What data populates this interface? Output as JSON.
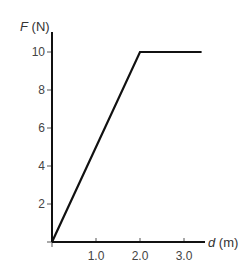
{
  "chart_data": {
    "type": "line",
    "title": "",
    "xlabel": "d (m)",
    "xlabel_var": "d",
    "xlabel_unit": " (m)",
    "ylabel": "F (N)",
    "ylabel_var": "F",
    "ylabel_unit": " (N)",
    "xlim": [
      0,
      3.5
    ],
    "ylim": [
      0,
      10.5
    ],
    "grid": false,
    "legend": null,
    "x_ticks": [
      1.0,
      2.0,
      3.0
    ],
    "x_tick_labels": [
      "1.0",
      "2.0",
      "3.0"
    ],
    "y_ticks": [
      2,
      4,
      6,
      8,
      10
    ],
    "y_tick_labels": [
      "2",
      "4",
      "6",
      "8",
      "10"
    ],
    "series": [
      {
        "name": "F vs d",
        "x": [
          0.0,
          2.0,
          3.4
        ],
        "y": [
          0,
          10,
          10
        ],
        "color": "#111111"
      }
    ]
  }
}
